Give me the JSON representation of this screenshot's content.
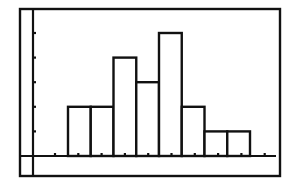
{
  "chart_data": {
    "type": "bar",
    "subtype": "histogram",
    "title": "",
    "xlabel": "",
    "ylabel": "",
    "bin_index": [
      1,
      2,
      3,
      4,
      5,
      6,
      7,
      8
    ],
    "values": [
      2,
      2,
      4,
      3,
      5,
      2,
      1,
      1
    ],
    "x_ticks_count": 10,
    "y_ticks": [
      1,
      2,
      3,
      4,
      5
    ],
    "ylim": [
      0,
      5
    ],
    "grid": false,
    "legend": null,
    "colors": {
      "line": "#111111",
      "background": "#ffffff",
      "bar_fill": "#ffffff"
    }
  },
  "layout": {
    "frame": {
      "x": 20,
      "y": 9,
      "w": 260,
      "h": 167
    },
    "axis_origin": {
      "x": 33,
      "y": 156
    },
    "x_axis_end": 276,
    "y_unit_px": 24.6,
    "first_bar_left": 68,
    "bar_width": 22.75,
    "first_x_tick": 55,
    "x_tick_spacing": 23.3
  }
}
